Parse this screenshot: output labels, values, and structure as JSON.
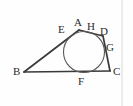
{
  "figure": {
    "kind": "geometry-diagram",
    "background_color": "#fefefe",
    "line_color": "#3a3a3a",
    "circle_color": "#5a5a5a",
    "label_color": "#2b2b2b",
    "border_color": "#d8d8d8",
    "labels": [
      {
        "id": "A",
        "text": "A",
        "x": 74,
        "y": 17
      },
      {
        "id": "E",
        "text": "E",
        "x": 58,
        "y": 24
      },
      {
        "id": "H",
        "text": "H",
        "x": 87,
        "y": 21
      },
      {
        "id": "D",
        "text": "D",
        "x": 100,
        "y": 26
      },
      {
        "id": "G",
        "text": "G",
        "x": 106,
        "y": 42
      },
      {
        "id": "B",
        "text": "B",
        "x": 13,
        "y": 66
      },
      {
        "id": "F",
        "text": "F",
        "x": 78,
        "y": 76
      },
      {
        "id": "C",
        "text": "C",
        "x": 113,
        "y": 66
      }
    ],
    "points": {
      "A": {
        "x": 79,
        "y": 30
      },
      "E": {
        "x": 65,
        "y": 34
      },
      "H": {
        "x": 93,
        "y": 31
      },
      "D": {
        "x": 103,
        "y": 36
      },
      "G": {
        "x": 107,
        "y": 50
      },
      "B": {
        "x": 24,
        "y": 72
      },
      "F": {
        "x": 84,
        "y": 72
      },
      "C": {
        "x": 110,
        "y": 71
      }
    },
    "edges": [
      {
        "name": "side-BA",
        "from": "B",
        "to": "A"
      },
      {
        "name": "side-AD",
        "from": "A",
        "to": "D"
      },
      {
        "name": "side-DC",
        "from": "D",
        "to": "C"
      },
      {
        "name": "side-BC",
        "from": "B",
        "to": "C"
      }
    ],
    "incircle": {
      "name": "inscribed-circle",
      "cx": 84,
      "cy": 52,
      "r": 20.5
    },
    "frame": {
      "name": "right-border-rule",
      "x": 122
    }
  }
}
